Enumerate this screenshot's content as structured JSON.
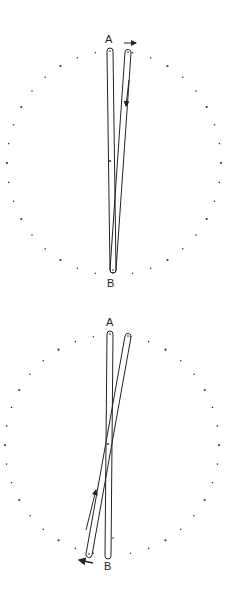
{
  "figures": [
    {
      "id": "top",
      "label_top": "A",
      "label_bottom": "B",
      "center": [
        114,
        163
      ],
      "dot_rx": 107,
      "dot_ry": 112,
      "dot_count": 36,
      "bars": [
        {
          "x1": 110,
          "y1": 51,
          "x2": 113,
          "y2": 270
        },
        {
          "x1": 128,
          "y1": 52,
          "x2": 113,
          "y2": 270
        }
      ],
      "arrows": [
        {
          "desc": "rightward arrow near top",
          "x1": 124,
          "y1": 43,
          "x2": 136,
          "y2": 43
        },
        {
          "desc": "downward arrow on right bar",
          "x1": 129,
          "y1": 80,
          "x2": 126,
          "y2": 108
        }
      ]
    },
    {
      "id": "bottom",
      "label_top": "A",
      "label_bottom": "B",
      "center": [
        112,
        445
      ],
      "dot_rx": 107,
      "dot_ry": 110,
      "dot_count": 36,
      "bars": [
        {
          "x1": 110,
          "y1": 334,
          "x2": 108,
          "y2": 556
        },
        {
          "x1": 128,
          "y1": 336,
          "x2": 89,
          "y2": 554
        }
      ],
      "arrows": [
        {
          "desc": "upward arrow along left-leaning bar",
          "x1": 86,
          "y1": 532,
          "x2": 96,
          "y2": 490
        },
        {
          "desc": "leftward arrow at bottom",
          "x1": 93,
          "y1": 563,
          "x2": 79,
          "y2": 560
        }
      ]
    }
  ],
  "colors": {
    "ink": "#222222",
    "background": "#ffffff"
  }
}
